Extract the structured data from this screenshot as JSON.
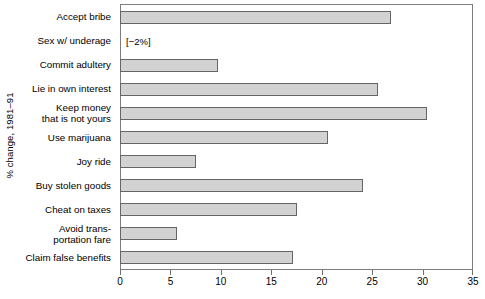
{
  "chart_data": {
    "type": "bar",
    "orientation": "horizontal",
    "title": "",
    "subtitle": "",
    "xlabel": "",
    "ylabel": "% change, 1981–91",
    "xlim": [
      0,
      35
    ],
    "ylim": null,
    "grid": false,
    "legend": null,
    "xticks": [
      0,
      5,
      10,
      15,
      20,
      25,
      30,
      35
    ],
    "xticklabels": [
      "0",
      "5",
      "10",
      "15",
      "20",
      "25",
      "30",
      "35"
    ],
    "bar_color": "#d2d2d2",
    "bar_edge_color": "#656565",
    "categories": [
      "Accept bribe",
      "Sex w/ underage",
      "Commit adultery",
      "Lie in own interest",
      "Keep money\nthat is not yours",
      "Use marijuana",
      "Joy ride",
      "Buy stolen goods",
      "Cheat on taxes",
      "Avoid trans-\nportation fare",
      "Claim false benefits"
    ],
    "values": [
      26.9,
      -2,
      9.7,
      25.6,
      30.4,
      20.6,
      7.5,
      24.1,
      17.5,
      5.7,
      17.2
    ],
    "annotations": [
      {
        "category": "Sex w/ underage",
        "text": "[−2%]"
      }
    ]
  },
  "axis": {
    "y_title": "% change, 1981–91"
  }
}
